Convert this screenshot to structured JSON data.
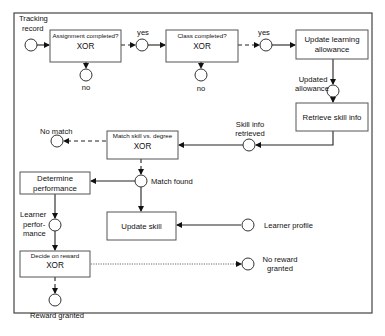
{
  "diagram": {
    "type": "event-driven process chain",
    "events": {
      "tracking_record": {
        "line1": "Tracking",
        "line2": "record"
      },
      "assignment_no": "no",
      "assignment_yes": "yes",
      "class_no": "no",
      "class_yes": "yes",
      "updated_allowance": {
        "line1": "Updated",
        "line2": "allowance"
      },
      "skill_info_retrieved": {
        "line1": "Skill info",
        "line2": "retrieved"
      },
      "no_match": "No match",
      "match_found": "Match found",
      "learner_profile": "Learner profile",
      "learner_performance": {
        "line1": "Learner",
        "line2": "perfor-",
        "line3": "mance"
      },
      "no_reward_granted": {
        "line1": "No reward",
        "line2": "granted"
      },
      "reward_granted": "Reward granted"
    },
    "functions": {
      "assignment_completed": {
        "title": "Assignment completed?",
        "operator": "XOR"
      },
      "class_completed": {
        "title": "Class completed?",
        "operator": "XOR"
      },
      "update_learning_allowance": {
        "line1": "Update learning",
        "line2": "allowance"
      },
      "retrieve_skill_info": "Retrieve skill info",
      "match_skill_vs_degree": {
        "title": "Match skill vs. degree",
        "operator": "XOR"
      },
      "determine_performance": {
        "line1": "Determine",
        "line2": "performance"
      },
      "update_skill": "Update skill",
      "decide_on_reward": {
        "title": "Decide on reward",
        "operator": "XOR"
      }
    }
  }
}
